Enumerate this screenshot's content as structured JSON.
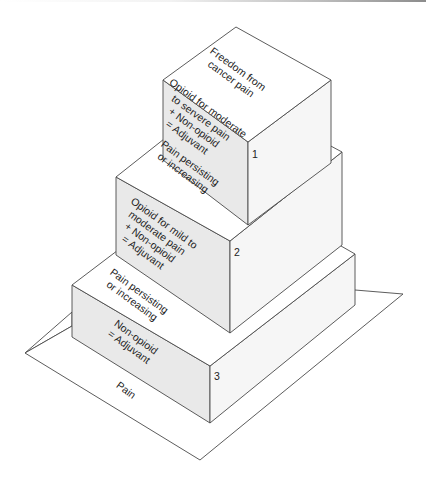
{
  "diagram": {
    "title": "",
    "base": {
      "label": "Pain"
    },
    "steps": [
      {
        "number": "1",
        "top_label": [
          "Freedom from",
          "cancer pain"
        ],
        "side_label": [
          "Opioid for moderate",
          "to servere pain",
          "+ Non-opioid",
          "= Adjuvant"
        ]
      },
      {
        "number": "2",
        "top_label": [
          "Pain persisting",
          "or increasing"
        ],
        "side_label": [
          "Opioid for mild to",
          "moderate pain",
          "+ Non-opioid",
          "= Adjuvant"
        ]
      },
      {
        "number": "3",
        "top_label": [
          "Pain persisting",
          "or increasing"
        ],
        "side_label": [
          "Non-opioid",
          "= Adjuvant"
        ]
      }
    ]
  }
}
